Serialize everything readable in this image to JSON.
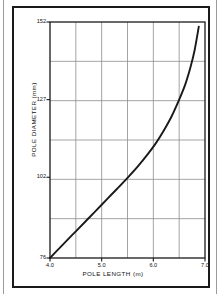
{
  "figure": {
    "frame_color": "#1a1a1a",
    "background": "#ffffff"
  },
  "chart_data": {
    "type": "line",
    "title": "",
    "xlabel": "POLE  LENGTH  (m)",
    "ylabel": "POLE  DIAMETER  (mm)",
    "xlim": [
      4.0,
      7.0
    ],
    "ylim": [
      76,
      152
    ],
    "grid": true,
    "grid_color": "#8d8d8d",
    "grid_columns": 6,
    "grid_rows": 6,
    "legend": null,
    "legend_position": "none",
    "line_color": "#1a1a1a",
    "xticks": [
      4.0,
      5.0,
      6.0,
      7.0
    ],
    "xtick_labels": [
      "4.0",
      "5.0",
      "6.0",
      "7.0"
    ],
    "yticks": [
      76,
      102,
      127,
      152
    ],
    "ytick_labels": [
      "76",
      "102",
      "127",
      "152"
    ],
    "series": [
      {
        "name": "pole diameter",
        "x": [
          4.0,
          4.15,
          4.3,
          4.5,
          4.7,
          4.9,
          5.1,
          5.3,
          5.5,
          5.7,
          5.9,
          6.05,
          6.2,
          6.35,
          6.5,
          6.62,
          6.72,
          6.8,
          6.88
        ],
        "y": [
          76.0,
          78.6,
          81.2,
          84.6,
          88.0,
          91.4,
          94.9,
          98.3,
          101.8,
          105.5,
          109.6,
          113.0,
          117.0,
          121.5,
          127.0,
          132.0,
          137.5,
          143.0,
          150.5
        ]
      }
    ]
  },
  "axis_titles": {
    "y": "POLE  DIAMETER  (mm)",
    "x": "POLE  LENGTH  (m)"
  }
}
